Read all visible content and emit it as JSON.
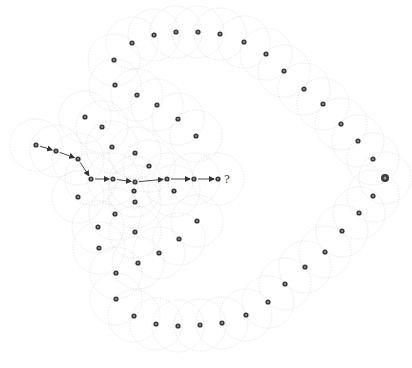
{
  "diagram": {
    "title": "",
    "width": 412,
    "height": 368,
    "colors": {
      "background": "#ffffff",
      "node": "#3a3a3a",
      "node_center": "#9a9a9a",
      "range_circle": "#d6d6d6",
      "edge": "#333333"
    },
    "range_radius": 26,
    "nodes": [
      {
        "id": "a1",
        "x": 36,
        "y": 145
      },
      {
        "id": "a2",
        "x": 56,
        "y": 151
      },
      {
        "id": "a3",
        "x": 78,
        "y": 159
      },
      {
        "id": "a4",
        "x": 91,
        "y": 179
      },
      {
        "id": "a5",
        "x": 113,
        "y": 179
      },
      {
        "id": "a6",
        "x": 135,
        "y": 182
      },
      {
        "id": "a7",
        "x": 167,
        "y": 179
      },
      {
        "id": "a8",
        "x": 194,
        "y": 179
      },
      {
        "id": "a9",
        "x": 218,
        "y": 179
      },
      {
        "id": "t1",
        "x": 114,
        "y": 60
      },
      {
        "id": "t2",
        "x": 132,
        "y": 43
      },
      {
        "id": "t3",
        "x": 154,
        "y": 35
      },
      {
        "id": "t4",
        "x": 176,
        "y": 32
      },
      {
        "id": "t5",
        "x": 198,
        "y": 32
      },
      {
        "id": "t6",
        "x": 220,
        "y": 34
      },
      {
        "id": "t7",
        "x": 244,
        "y": 42
      },
      {
        "id": "t8",
        "x": 266,
        "y": 54
      },
      {
        "id": "t9",
        "x": 284,
        "y": 71
      },
      {
        "id": "t10",
        "x": 304,
        "y": 89
      },
      {
        "id": "t11",
        "x": 323,
        "y": 104
      },
      {
        "id": "t12",
        "x": 341,
        "y": 124
      },
      {
        "id": "t13",
        "x": 358,
        "y": 141
      },
      {
        "id": "t14",
        "x": 373,
        "y": 159
      },
      {
        "id": "r1",
        "x": 373,
        "y": 196
      },
      {
        "id": "r2",
        "x": 359,
        "y": 213
      },
      {
        "id": "r3",
        "x": 342,
        "y": 231
      },
      {
        "id": "r4",
        "x": 325,
        "y": 252
      },
      {
        "id": "r5",
        "x": 305,
        "y": 267
      },
      {
        "id": "r6",
        "x": 285,
        "y": 284
      },
      {
        "id": "r7",
        "x": 268,
        "y": 302
      },
      {
        "id": "r8",
        "x": 246,
        "y": 315
      },
      {
        "id": "r9",
        "x": 222,
        "y": 323
      },
      {
        "id": "b1",
        "x": 200,
        "y": 325
      },
      {
        "id": "b2",
        "x": 178,
        "y": 326
      },
      {
        "id": "b3",
        "x": 156,
        "y": 324
      },
      {
        "id": "b4",
        "x": 134,
        "y": 316
      },
      {
        "id": "b5",
        "x": 116,
        "y": 299
      },
      {
        "id": "i1",
        "x": 115,
        "y": 85
      },
      {
        "id": "i2",
        "x": 137,
        "y": 95
      },
      {
        "id": "i3",
        "x": 157,
        "y": 105
      },
      {
        "id": "i4",
        "x": 178,
        "y": 119
      },
      {
        "id": "i5",
        "x": 196,
        "y": 136
      },
      {
        "id": "i6",
        "x": 85,
        "y": 117
      },
      {
        "id": "i7",
        "x": 102,
        "y": 127
      },
      {
        "id": "i8",
        "x": 112,
        "y": 147
      },
      {
        "id": "i9",
        "x": 135,
        "y": 153
      },
      {
        "id": "i10",
        "x": 149,
        "y": 166
      },
      {
        "id": "i11",
        "x": 174,
        "y": 191
      },
      {
        "id": "l1",
        "x": 78,
        "y": 197
      },
      {
        "id": "l2",
        "x": 134,
        "y": 191
      },
      {
        "id": "l3",
        "x": 135,
        "y": 202
      },
      {
        "id": "l4",
        "x": 115,
        "y": 214
      },
      {
        "id": "l5",
        "x": 197,
        "y": 221
      },
      {
        "id": "l6",
        "x": 98,
        "y": 227
      },
      {
        "id": "l7",
        "x": 135,
        "y": 232
      },
      {
        "id": "l8",
        "x": 179,
        "y": 239
      },
      {
        "id": "l9",
        "x": 99,
        "y": 248
      },
      {
        "id": "l10",
        "x": 159,
        "y": 253
      },
      {
        "id": "l11",
        "x": 138,
        "y": 263
      },
      {
        "id": "l12",
        "x": 116,
        "y": 273
      }
    ],
    "target_node": {
      "id": "goal",
      "x": 385,
      "y": 178
    },
    "path": [
      "a1",
      "a2",
      "a3",
      "a4",
      "a5",
      "a6",
      "a7",
      "a8",
      "a9"
    ],
    "unknown_label": {
      "text": "?",
      "x": 224,
      "y": 183
    }
  }
}
